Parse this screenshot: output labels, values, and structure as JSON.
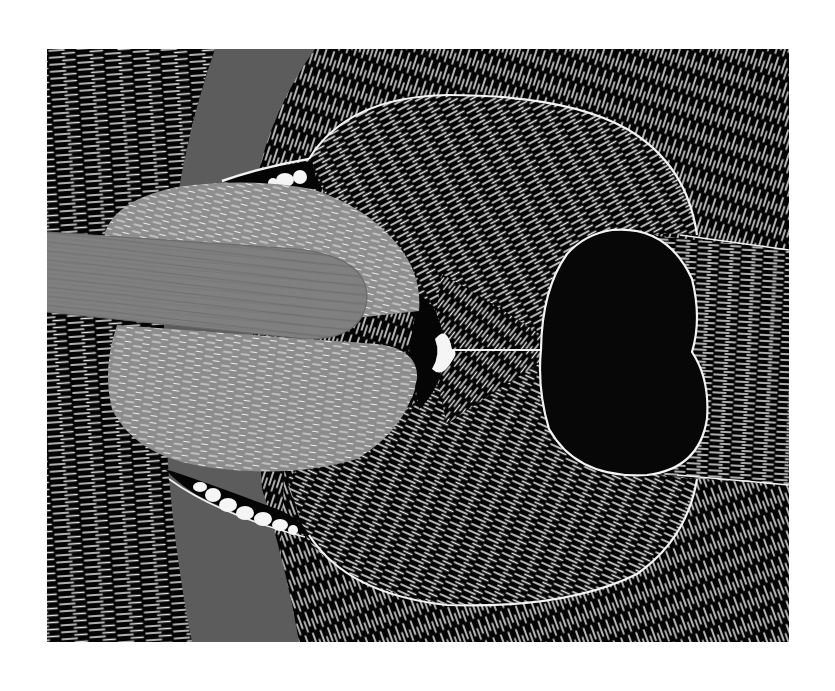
{
  "artwork": {
    "title": "Dog with stick, linocut print",
    "subject": "Top-down view of a black dog's muzzle holding a wooden stick in its mouth",
    "frame": {
      "x": 47,
      "y": 49,
      "width": 742,
      "height": 593
    },
    "page_background": "#ffffff"
  },
  "palette": {
    "ink_black": "#050505",
    "carve_white": "#f2f2f2",
    "band_gray": "#5c5c5c",
    "tongue_gray": "#8e8e8e",
    "stick_gray": "#7f7f7f",
    "stick_grain": "#5e5e5e",
    "nose_black": "#070707",
    "outline_white": "#f4f4f4"
  },
  "elements": {
    "background_texture": "horizontal-dash-hatching-left",
    "gray_band": "curved-collar-band",
    "fur": "radial-carved-fur-strokes",
    "muzzle_lobes": [
      "upper-lip-lobe",
      "lower-lip-lobe"
    ],
    "nose": "kidney-shaped-black-nose",
    "stick": "wood-grain-stick",
    "tongue": [
      "upper-tongue-lobe",
      "lower-tongue-lobe"
    ],
    "teeth": {
      "upper_count": 3,
      "lower_count": 7
    },
    "whisker_lines": [
      "nose-to-edge-top",
      "nose-to-edge-bottom"
    ],
    "philtrum_line": "mouth-to-nose"
  }
}
